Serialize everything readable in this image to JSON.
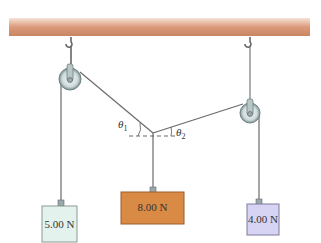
{
  "diagram": {
    "ceiling": {
      "color": "#d9957a"
    },
    "weights": [
      {
        "label": "5.00 N",
        "color": "#e3f2ec"
      },
      {
        "label": "8.00 N",
        "color": "#d98a45"
      },
      {
        "label": "4.00 N",
        "color": "#d6d4f2"
      }
    ],
    "angles": [
      {
        "symbol": "θ",
        "subscript": "1"
      },
      {
        "symbol": "θ",
        "subscript": "2"
      }
    ]
  }
}
